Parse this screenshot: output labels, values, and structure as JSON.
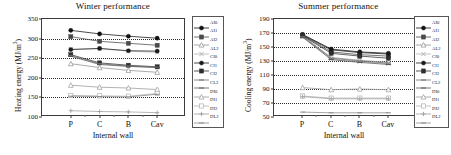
{
  "figure": {
    "panels": [
      {
        "id": "winter",
        "title": "Winter performance",
        "xlabel": "Internal wall",
        "ylabel_prefix": "Heating energy (MJ/m",
        "ylabel_sup": "3",
        "ylabel_suffix": ")"
      },
      {
        "id": "summer",
        "title": "Summer performance",
        "xlabel": "Internal wall",
        "ylabel_prefix": "Cooling energy (MJ/m",
        "ylabel_sup": "3",
        "ylabel_suffix": ")"
      }
    ]
  },
  "legend": {
    "labels": [
      "AI0",
      "AI1",
      "AI2",
      "AL2",
      "CI0",
      "CI1",
      "CI2",
      "CL2",
      "DI0",
      "DI1",
      "DI2",
      "DL2"
    ]
  },
  "style": {
    "colors": {
      "AI0": "#101010",
      "AI1": "#4a4a4a",
      "AI2": "#8f8f8f",
      "AL2": "#b4b4b4",
      "CI0": "#1a1a1a",
      "CI1": "#2e2e2e",
      "CI2": "#707070",
      "CL2": "#585858",
      "DI0": "#9a9a9a",
      "DI1": "#b0b0b0",
      "DI2": "#a0a0a0",
      "DL2": "#8a8a8a"
    },
    "markers": {
      "AI0": "circle-filled",
      "AI1": "square-filled",
      "AI2": "triangle-open",
      "AL2": "cross",
      "CI0": "circle-filled",
      "CI1": "square-filled",
      "CI2": "dash",
      "CL2": "dash",
      "DI0": "triangle-open",
      "DI1": "square-open",
      "DI2": "plus",
      "DL2": "dash"
    }
  },
  "chart_data": [
    {
      "type": "line",
      "id": "winter",
      "title": "Winter performance",
      "xlabel": "Internal wall",
      "ylabel": "Heating energy (MJ/m3)",
      "categories": [
        "P",
        "C",
        "B",
        "Cav"
      ],
      "ylim": [
        100,
        350
      ],
      "yticks": [
        100,
        150,
        200,
        250,
        300,
        350
      ],
      "grid": true,
      "legend_position": "right-outside",
      "series": [
        {
          "name": "AI0",
          "values": [
            321,
            312,
            306,
            301
          ]
        },
        {
          "name": "AI1",
          "values": [
            305,
            293,
            288,
            283
          ]
        },
        {
          "name": "AI2",
          "values": [
            236,
            226,
            219,
            214
          ]
        },
        {
          "name": "AL2",
          "values": [
            273,
            274,
            268,
            265
          ]
        },
        {
          "name": "CI0",
          "values": [
            272,
            275,
            269,
            268
          ]
        },
        {
          "name": "CI1",
          "values": [
            259,
            238,
            232,
            228
          ]
        },
        {
          "name": "CI2",
          "values": [
            257,
            236,
            230,
            227
          ]
        },
        {
          "name": "CL2",
          "values": [
            255,
            234,
            229,
            226
          ]
        },
        {
          "name": "DI0",
          "values": [
            181,
            176,
            174,
            170
          ]
        },
        {
          "name": "DI1",
          "values": [
            155,
            154,
            153,
            160
          ]
        },
        {
          "name": "DI2",
          "values": [
            116,
            114,
            113,
            111
          ]
        },
        {
          "name": "DL2",
          "values": [
            153,
            152,
            151,
            158
          ]
        }
      ]
    },
    {
      "type": "line",
      "id": "summer",
      "title": "Summer performance",
      "xlabel": "Internal wall",
      "ylabel": "Cooling energy (MJ/m3)",
      "categories": [
        "P",
        "C",
        "B",
        "Cav"
      ],
      "ylim": [
        50,
        190
      ],
      "yticks": [
        50,
        70,
        90,
        110,
        130,
        150,
        170,
        190
      ],
      "grid": true,
      "legend_position": "right-outside",
      "series": [
        {
          "name": "AI0",
          "values": [
            168,
            147,
            143,
            141
          ]
        },
        {
          "name": "AI1",
          "values": [
            167,
            143,
            139,
            137
          ]
        },
        {
          "name": "AI2",
          "values": [
            166,
            135,
            131,
            128
          ]
        },
        {
          "name": "AL2",
          "values": [
            165,
            133,
            129,
            126
          ]
        },
        {
          "name": "CI0",
          "values": [
            167,
            146,
            142,
            140
          ]
        },
        {
          "name": "CI1",
          "values": [
            166,
            141,
            137,
            134
          ]
        },
        {
          "name": "CI2",
          "values": [
            165,
            134,
            130,
            127
          ]
        },
        {
          "name": "CL2",
          "values": [
            164,
            132,
            128,
            125
          ]
        },
        {
          "name": "DI0",
          "values": [
            92,
            89,
            90,
            89
          ]
        },
        {
          "name": "DI1",
          "values": [
            80,
            77,
            77,
            77
          ]
        },
        {
          "name": "DI2",
          "values": [
            79,
            76,
            76,
            76
          ]
        },
        {
          "name": "DL2",
          "values": [
            57,
            56,
            56,
            56
          ]
        }
      ]
    }
  ]
}
